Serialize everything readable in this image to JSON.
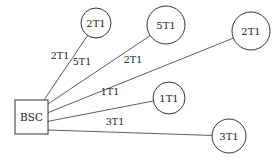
{
  "diagram": {
    "hub": {
      "label": "BSC",
      "x": 15,
      "y": 100,
      "w": 33,
      "h": 34
    },
    "nodes": [
      {
        "label": "2T1",
        "cx": 96,
        "cy": 23,
        "r": 15,
        "edge_label": "2T1",
        "lx": 60,
        "ly": 59
      },
      {
        "label": "5T1",
        "cx": 166,
        "cy": 25,
        "r": 19,
        "edge_label": "5T1",
        "lx": 82,
        "ly": 65
      },
      {
        "label": "2T1",
        "cx": 251,
        "cy": 31,
        "r": 19,
        "edge_label": "2T1",
        "lx": 133,
        "ly": 63
      },
      {
        "label": "1T1",
        "cx": 169,
        "cy": 98,
        "r": 16,
        "edge_label": "1T1",
        "lx": 110,
        "ly": 95
      },
      {
        "label": "3T1",
        "cx": 229,
        "cy": 136,
        "r": 17,
        "edge_label": "3T1",
        "lx": 115,
        "ly": 125
      }
    ],
    "colors": {
      "stroke": "#333333",
      "text": "#222222",
      "background": "#ffffff"
    }
  }
}
